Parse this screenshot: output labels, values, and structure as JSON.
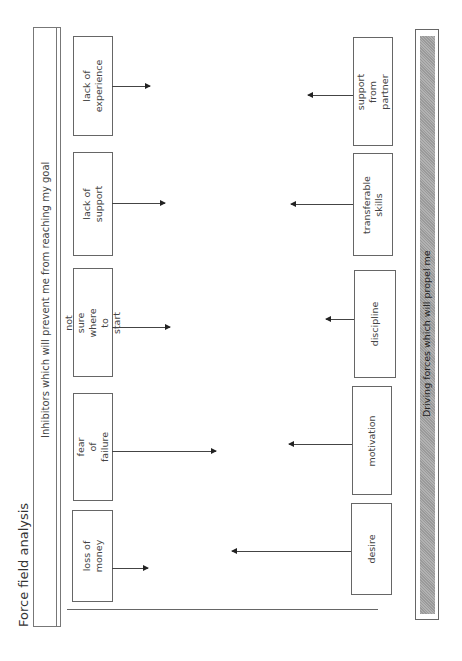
{
  "title": "Force field analysis",
  "inhibitors_header": "Inhibitors which will prevent me from reaching my goal",
  "driving_header": "Driving forces which will propel me",
  "inhibitors": [
    {
      "label": "lack of\nexperience",
      "box": {
        "x": 73,
        "y": 36,
        "w": 40,
        "h": 100
      },
      "arrow": {
        "y": 86,
        "x1": 112,
        "x2": 150
      }
    },
    {
      "label": "lack of\nsupport",
      "box": {
        "x": 73,
        "y": 152,
        "w": 40,
        "h": 104
      },
      "arrow": {
        "y": 203,
        "x1": 112,
        "x2": 165
      }
    },
    {
      "label": "not sure where to\nstart",
      "box": {
        "x": 73,
        "y": 268,
        "w": 40,
        "h": 109
      },
      "arrow": {
        "y": 327,
        "x1": 112,
        "x2": 170
      }
    },
    {
      "label": "fear of failure",
      "box": {
        "x": 73,
        "y": 393,
        "w": 40,
        "h": 108
      },
      "arrow": {
        "y": 451,
        "x1": 112,
        "x2": 216
      }
    },
    {
      "label": "loss of money",
      "box": {
        "x": 72,
        "y": 510,
        "w": 41,
        "h": 92
      },
      "arrow": {
        "y": 568,
        "x1": 112,
        "x2": 148
      }
    }
  ],
  "driving_forces": [
    {
      "label": "support from\npartner",
      "box": {
        "x": 353,
        "y": 37,
        "w": 40,
        "h": 109
      },
      "arrow": {
        "y": 95,
        "x1": 308,
        "x2": 353
      }
    },
    {
      "label": "transferable skills",
      "box": {
        "x": 353,
        "y": 153,
        "w": 40,
        "h": 103
      },
      "arrow": {
        "y": 204,
        "x1": 291,
        "x2": 353
      }
    },
    {
      "label": "discipline",
      "box": {
        "x": 354,
        "y": 270,
        "w": 42,
        "h": 108
      },
      "arrow": {
        "y": 319,
        "x1": 326,
        "x2": 354
      }
    },
    {
      "label": "motivation",
      "box": {
        "x": 352,
        "y": 386,
        "w": 40,
        "h": 109
      },
      "arrow": {
        "y": 444,
        "x1": 289,
        "x2": 352
      }
    },
    {
      "label": "desire",
      "box": {
        "x": 351,
        "y": 503,
        "w": 41,
        "h": 92
      },
      "arrow": {
        "y": 551,
        "x1": 232,
        "x2": 351
      }
    }
  ],
  "colors": {
    "bar_fill": "#a6a6a6",
    "line": "#555555"
  }
}
